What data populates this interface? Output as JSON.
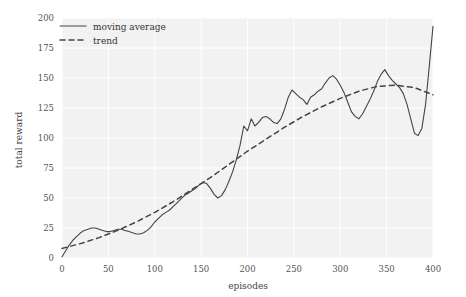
{
  "chart_data": {
    "type": "line",
    "title": "",
    "xlabel": "episodes",
    "ylabel": "total reward",
    "xlim": [
      0,
      400
    ],
    "ylim": [
      0,
      200
    ],
    "xticks": [
      0,
      50,
      100,
      150,
      200,
      250,
      300,
      350,
      400
    ],
    "yticks": [
      0,
      25,
      50,
      75,
      100,
      125,
      150,
      175,
      200
    ],
    "grid": true,
    "legend_position": "upper left",
    "background_color": "#f2f2f2",
    "grid_color": "#ffffff",
    "line_color": "#444444",
    "series": [
      {
        "name": "moving average",
        "style": "solid",
        "x": [
          0,
          4,
          8,
          12,
          16,
          20,
          24,
          28,
          32,
          36,
          40,
          44,
          48,
          52,
          56,
          60,
          64,
          68,
          72,
          76,
          80,
          84,
          88,
          92,
          96,
          100,
          104,
          108,
          112,
          116,
          120,
          124,
          128,
          132,
          136,
          140,
          144,
          148,
          152,
          156,
          160,
          164,
          168,
          172,
          176,
          180,
          184,
          188,
          192,
          196,
          200,
          204,
          208,
          212,
          216,
          220,
          224,
          228,
          232,
          236,
          240,
          244,
          248,
          252,
          256,
          260,
          264,
          268,
          272,
          276,
          280,
          284,
          288,
          292,
          296,
          300,
          304,
          308,
          312,
          316,
          320,
          324,
          328,
          332,
          336,
          340,
          344,
          348,
          352,
          356,
          360,
          364,
          368,
          372,
          376,
          380,
          384,
          388,
          392,
          396,
          400
        ],
        "y": [
          1,
          6,
          11,
          15,
          18,
          21,
          23,
          24,
          25,
          25,
          24,
          23,
          22,
          22,
          23,
          24,
          24,
          23,
          22,
          21,
          20,
          20,
          21,
          23,
          26,
          30,
          33,
          36,
          38,
          40,
          43,
          46,
          49,
          52,
          54,
          56,
          58,
          61,
          63,
          62,
          58,
          53,
          50,
          52,
          57,
          64,
          72,
          82,
          94,
          110,
          106,
          116,
          110,
          113,
          117,
          118,
          116,
          113,
          112,
          116,
          124,
          134,
          140,
          137,
          134,
          132,
          128,
          134,
          136,
          139,
          141,
          146,
          150,
          152,
          149,
          144,
          138,
          130,
          122,
          118,
          116,
          120,
          126,
          132,
          139,
          147,
          153,
          157,
          152,
          148,
          145,
          142,
          137,
          128,
          116,
          104,
          102,
          108,
          128,
          160,
          193
        ]
      },
      {
        "name": "trend",
        "style": "dashed",
        "x": [
          0,
          20,
          40,
          60,
          80,
          100,
          120,
          140,
          160,
          180,
          200,
          220,
          240,
          260,
          280,
          300,
          320,
          340,
          360,
          380,
          400
        ],
        "y": [
          8,
          12,
          17,
          23,
          30,
          38,
          47,
          57,
          67,
          78,
          89,
          99,
          109,
          118,
          126,
          133,
          139,
          143,
          144,
          142,
          136
        ]
      }
    ]
  },
  "legend": {
    "entries": [
      {
        "label": "moving average",
        "style": "solid"
      },
      {
        "label": "trend",
        "style": "dashed"
      }
    ]
  },
  "axes": {
    "x_title": "episodes",
    "y_title": "total reward"
  }
}
